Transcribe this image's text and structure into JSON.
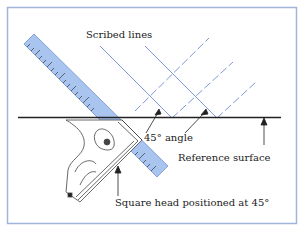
{
  "figure": {
    "labels": {
      "scribed_lines": "Scribed lines",
      "angle": "45° angle",
      "reference_surface": "Reference surface",
      "square_head": "Square head positioned at 45°"
    },
    "colors": {
      "frame": "#9fb5dd",
      "ruler_fill": "#a9c4ef",
      "ruler_edge": "#6f93cf",
      "scribed_line": "#7d98d4",
      "ink": "#222222"
    }
  }
}
